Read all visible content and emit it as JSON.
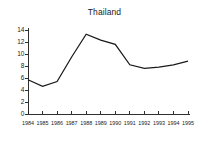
{
  "chart_data": {
    "type": "line",
    "title": "Thailand",
    "xlabel": "",
    "ylabel": "",
    "x": [
      1984,
      1985,
      1986,
      1987,
      1988,
      1989,
      1990,
      1991,
      1992,
      1993,
      1994,
      1995
    ],
    "categories": [
      "1984",
      "1985",
      "1986",
      "1987",
      "1988",
      "1989",
      "1990",
      "1991",
      "1992",
      "1993",
      "1994",
      "1995"
    ],
    "values": [
      5.7,
      4.6,
      5.4,
      9.5,
      13.3,
      12.3,
      11.6,
      8.2,
      7.6,
      7.8,
      8.2,
      8.8
    ],
    "series": [
      {
        "name": "Thailand",
        "values": [
          5.7,
          4.6,
          5.4,
          9.5,
          13.3,
          12.3,
          11.6,
          8.2,
          7.6,
          7.8,
          8.2,
          8.8
        ]
      }
    ],
    "ylim": [
      0,
      14
    ],
    "xlim": [
      1984,
      1995
    ],
    "yticks": [
      0,
      2,
      4,
      6,
      8,
      10,
      12,
      14
    ],
    "ytick_labels": [
      "0",
      "2",
      "4",
      "6",
      "8",
      "10",
      "12",
      "14"
    ],
    "xtick_labels": [
      "1984",
      "1985",
      "1986",
      "1987",
      "1988",
      "1989",
      "1990",
      "1991",
      "1992",
      "1993",
      "1994",
      "1995"
    ],
    "grid": false,
    "legend": false,
    "legend_position": "none",
    "line_color": "#1a1a1a",
    "background_color": "#ffffff"
  }
}
